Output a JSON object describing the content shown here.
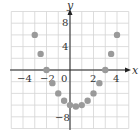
{
  "chart_data": {
    "type": "scatter",
    "title": "",
    "xlabel": "x",
    "ylabel": "y",
    "xlim": [
      -5,
      5
    ],
    "ylim": [
      -10,
      10
    ],
    "grid": true,
    "x_grid_step": 1,
    "y_grid_step": 2,
    "x_ticks": [
      -4,
      -2,
      0,
      2,
      4
    ],
    "y_ticks": [
      8,
      4,
      -8
    ],
    "tick_labels": {
      "x": [
        "−4",
        "−2",
        "0",
        "2",
        "4"
      ],
      "y": [
        "8",
        "4",
        "−8"
      ]
    },
    "series": [
      {
        "name": "points",
        "color": "#9a9a9a",
        "x": [
          -3,
          -2.5,
          -2,
          -1.5,
          -1,
          -0.5,
          0,
          0.5,
          1,
          1.5,
          2,
          2.5,
          3,
          3.5,
          4
        ],
        "y": [
          6,
          2.75,
          0,
          -2.25,
          -4,
          -5.25,
          -6,
          -6.25,
          -6,
          -5.25,
          -4,
          -2.25,
          0,
          2.75,
          6
        ]
      }
    ]
  },
  "labels": {
    "x_axis": "x",
    "y_axis": "y",
    "x_ticks": [
      "−4",
      "−2",
      "0",
      "2",
      "4"
    ],
    "y_tick_8": "8",
    "y_tick_4": "4",
    "y_tick_neg8": "−8"
  }
}
